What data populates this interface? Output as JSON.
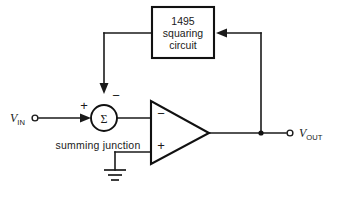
{
  "diagram": {
    "background_color": "#ffffff",
    "line_color": "#1a1a1a",
    "blocks": {
      "squaring_block": {
        "name": "1495 squaring circuit",
        "line1": "1495",
        "line2": "squaring",
        "line3": "circuit"
      },
      "opamp": {
        "name": "operational amplifier",
        "inverting_label": "−",
        "noninverting_label": "+"
      },
      "summing_junction": {
        "name": "summing junction",
        "symbol": "Σ",
        "caption": "summing  junction",
        "input_sign": "+",
        "feedback_sign": "−"
      }
    },
    "terminals": {
      "input": {
        "variable": "V",
        "subscript": "IN",
        "full_label": "VIN"
      },
      "output": {
        "variable": "V",
        "subscript": "OUT",
        "full_label": "VOUT"
      },
      "ground": {
        "name": "ground"
      }
    },
    "nodes": {
      "output_tap": "output feedback junction"
    }
  }
}
